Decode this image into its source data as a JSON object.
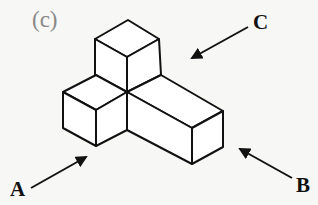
{
  "figure": {
    "panel_label": "(c)",
    "views": [
      {
        "label": "A",
        "direction": "arrow pointing up-right toward the front-left cube corner"
      },
      {
        "label": "B",
        "direction": "arrow pointing up-left toward the right end of the bar"
      },
      {
        "label": "C",
        "direction": "arrow pointing down-left toward the empty back-right area"
      }
    ],
    "colors": {
      "line": "#111111",
      "face": "#ffffff",
      "panel_label": "#888888",
      "background": "#f7f7f5"
    }
  }
}
